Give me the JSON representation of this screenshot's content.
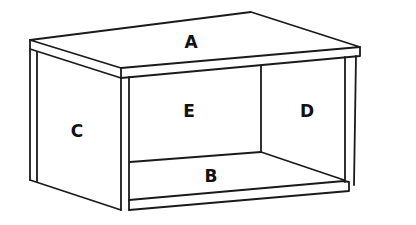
{
  "diagram": {
    "type": "exploded-box-panels",
    "labels": {
      "top": "A",
      "bottom": "B",
      "left_side": "C",
      "right_side": "D",
      "back": "E"
    },
    "colors": {
      "line": "#1a1a1a",
      "background": "#ffffff",
      "text": "#111111"
    }
  }
}
